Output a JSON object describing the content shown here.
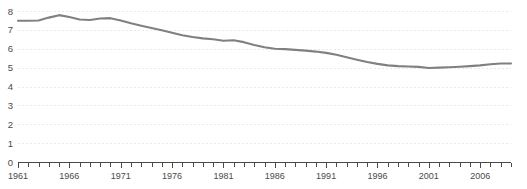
{
  "chart_data": {
    "type": "line",
    "title": "",
    "subtitle": "",
    "xlabel": "",
    "ylabel": "",
    "xlim": [
      1961,
      2009
    ],
    "ylim": [
      0,
      8
    ],
    "grid": true,
    "legend": false,
    "legend_position": "none",
    "line_color": "#808080",
    "axis_color": "#4a4a4a",
    "grid_color": "#e9e9e9",
    "background_color": "#ffffff",
    "y_ticks": [
      0,
      1,
      2,
      3,
      4,
      5,
      6,
      7,
      8
    ],
    "y_tick_labels": [
      "0",
      "1",
      "2",
      "3",
      "4",
      "5",
      "6",
      "7",
      "8"
    ],
    "x_ticks": [
      1961,
      1962,
      1963,
      1964,
      1965,
      1966,
      1967,
      1968,
      1969,
      1970,
      1971,
      1972,
      1973,
      1974,
      1975,
      1976,
      1977,
      1978,
      1979,
      1980,
      1981,
      1982,
      1983,
      1984,
      1985,
      1986,
      1987,
      1988,
      1989,
      1990,
      1991,
      1992,
      1993,
      1994,
      1995,
      1996,
      1997,
      1998,
      1999,
      2000,
      2001,
      2002,
      2003,
      2004,
      2005,
      2006,
      2007,
      2008,
      2009
    ],
    "x_tick_labels_shown": [
      "1961",
      "1966",
      "1971",
      "1976",
      "1981",
      "1986",
      "1991",
      "1996",
      "2001",
      "2006"
    ],
    "x_labeled_years": [
      1961,
      1966,
      1971,
      1976,
      1981,
      1986,
      1991,
      1996,
      2001,
      2006
    ],
    "series": [
      {
        "name": "series-1",
        "x": [
          1961,
          1962,
          1963,
          1964,
          1965,
          1966,
          1967,
          1968,
          1969,
          1970,
          1971,
          1972,
          1973,
          1974,
          1975,
          1976,
          1977,
          1978,
          1979,
          1980,
          1981,
          1982,
          1983,
          1984,
          1985,
          1986,
          1987,
          1988,
          1989,
          1990,
          1991,
          1992,
          1993,
          1994,
          1995,
          1996,
          1997,
          1998,
          1999,
          2000,
          2001,
          2002,
          2003,
          2004,
          2005,
          2006,
          2007,
          2008,
          2009
        ],
        "values": [
          7.48,
          7.48,
          7.5,
          7.65,
          7.78,
          7.68,
          7.55,
          7.52,
          7.6,
          7.62,
          7.5,
          7.35,
          7.22,
          7.1,
          6.98,
          6.85,
          6.72,
          6.62,
          6.55,
          6.5,
          6.42,
          6.45,
          6.35,
          6.2,
          6.08,
          6.0,
          5.98,
          5.94,
          5.9,
          5.85,
          5.78,
          5.68,
          5.55,
          5.42,
          5.3,
          5.2,
          5.12,
          5.08,
          5.06,
          5.04,
          4.98,
          5.0,
          5.02,
          5.05,
          5.08,
          5.12,
          5.18,
          5.22,
          5.22
        ]
      }
    ]
  }
}
